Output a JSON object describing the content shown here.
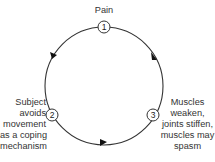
{
  "diagram": {
    "type": "cycle",
    "direction": "clockwise-via-2-then-3",
    "colors": {
      "line": "#333333",
      "node_fill": "#ffffff",
      "arrow": "#111111"
    },
    "nodes": [
      {
        "id": "1",
        "number": "1",
        "label": "Pain"
      },
      {
        "id": "2",
        "number": "2",
        "label_lines": [
          "Subject",
          "avoids",
          "movement",
          "as a coping",
          "mechanism"
        ]
      },
      {
        "id": "3",
        "number": "3",
        "label_lines": [
          "Muscles",
          "weaken,",
          "joints stiffen,",
          "muscles may",
          "spasm"
        ]
      }
    ],
    "edges": [
      {
        "from": "1",
        "to": "2"
      },
      {
        "from": "2",
        "to": "3"
      },
      {
        "from": "3",
        "to": "1"
      }
    ]
  }
}
